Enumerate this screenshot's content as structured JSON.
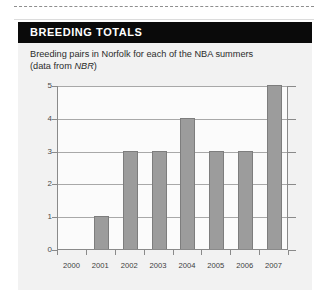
{
  "page": {
    "background_color": "#ffffff",
    "panel_background_color": "#f2f2f2",
    "header_background_color": "#0a0a0a",
    "header_text_color": "#ffffff",
    "bar_color": "#9c9c9c",
    "axis_color": "#8a8a8a",
    "gridline_color": "#a8a8a8"
  },
  "panel": {
    "title": "BREEDING TOTALS",
    "subtitle_line1": "Breeding pairs in Norfolk for each of the NBA summers",
    "subtitle_line2_pre": "(data from ",
    "subtitle_line2_em": "NBR",
    "subtitle_line2_post": ")"
  },
  "chart_data": {
    "type": "bar",
    "title": "",
    "subtitle": "Breeding pairs in Norfolk for each of the NBA summers (data from NBR)",
    "xlabel": "",
    "ylabel": "",
    "categories": [
      "2000",
      "2001",
      "2002",
      "2003",
      "2004",
      "2005",
      "2006",
      "2007"
    ],
    "values": [
      0,
      1,
      3,
      3,
      4,
      3,
      3,
      5
    ],
    "series": [
      {
        "name": "Breeding pairs",
        "values": [
          0,
          1,
          3,
          3,
          4,
          3,
          3,
          5
        ]
      }
    ],
    "ylim": [
      0,
      5
    ],
    "yticks": [
      0,
      1,
      2,
      3,
      4,
      5
    ],
    "ytick_labels": [
      "0",
      "1",
      "2",
      "3",
      "4",
      "5"
    ],
    "grid": true,
    "grid_axis": "y",
    "legend": false,
    "legend_position": "none"
  }
}
